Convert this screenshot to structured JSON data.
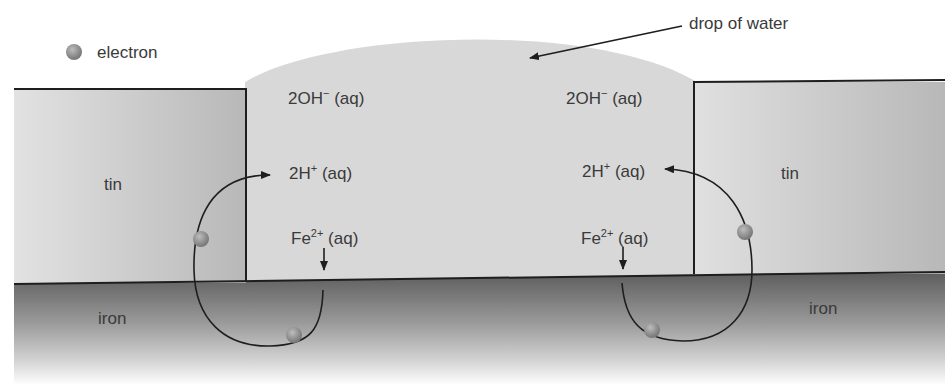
{
  "legend": {
    "electron_label": "electron",
    "electron_color": "#8a8a8a"
  },
  "callout": {
    "drop_label": "drop of water"
  },
  "materials": {
    "tin_left": "tin",
    "tin_right": "tin",
    "iron_left": "iron",
    "iron_right": "iron"
  },
  "species": {
    "left": {
      "hydroxide_main": "2OH",
      "hydroxide_charge": "−",
      "hydroxide_state": " (aq)",
      "hydrogen_main": "2H",
      "hydrogen_charge": "+",
      "hydrogen_state": " (aq)",
      "iron_ion_main": "Fe",
      "iron_ion_charge": "2+",
      "iron_ion_state": " (aq)"
    },
    "right": {
      "hydroxide_main": "2OH",
      "hydroxide_charge": "−",
      "hydroxide_state": " (aq)",
      "hydrogen_main": "2H",
      "hydrogen_charge": "+",
      "hydrogen_state": " (aq)",
      "iron_ion_main": "Fe",
      "iron_ion_charge": "2+",
      "iron_ion_state": " (aq)"
    }
  },
  "colors": {
    "water": "#d6d6d6",
    "tin": "#c4c4c4",
    "iron_top": "#5f5f5f",
    "iron_bottom": "#f4f4f4",
    "line": "#1e1e1e"
  }
}
